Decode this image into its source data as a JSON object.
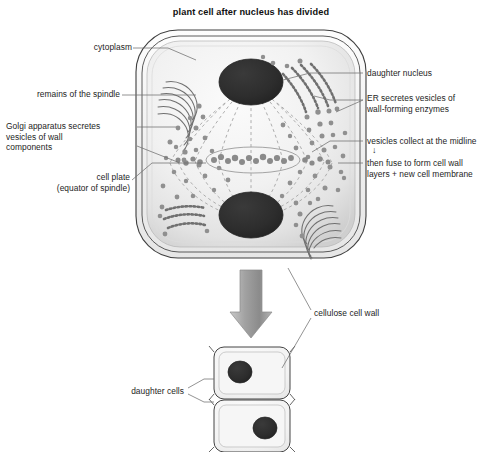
{
  "figure": {
    "title": "plant cell after nucleus has divided"
  },
  "colors": {
    "background": "#ffffff",
    "outline": "#3c3c3c",
    "cytoplasm_light": "#f4f4f4",
    "cytoplasm_shade": "#d9d9d9",
    "nucleus": "#2e2e2e",
    "vesicle": "#8c8c8c",
    "spindle": "#9a9a9a",
    "organelle": "#6e6e6e",
    "arrow": "#8f8f8f",
    "leader": "#6a6a6a",
    "text": "#1d1d1d"
  },
  "labels": {
    "cytoplasm": "cytoplasm",
    "remains_of_spindle": "remains of the spindle",
    "golgi": "Golgi apparatus secretes\nvesicles of wall\ncomponents",
    "cell_plate": "cell plate\n(equator of spindle)",
    "daughter_nucleus": "daughter nucleus",
    "er": "ER secretes vesicles of\nwall-forming enzymes",
    "vesicles_midline": "vesicles collect at the midline",
    "midline_arrow": "↓",
    "then_fuse": "then fuse to form cell wall\nlayers + new cell membrane",
    "cellulose_cell_wall": "cellulose cell wall",
    "daughter_cells": "daughter cells"
  },
  "structures": {
    "parent_cell": "rounded plant cell with double cellulose wall",
    "nuclei_count": 2,
    "golgi_count": 2,
    "er_count": 2,
    "daughter_cells_count": 2,
    "cell_plate": "band of vesicles at the spindle equator"
  }
}
